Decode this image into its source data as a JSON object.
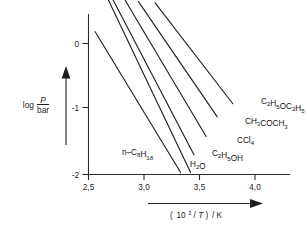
{
  "chart_data": {
    "type": "line",
    "title": "",
    "xlabel": "( 10³/T ) / K",
    "ylabel": "log P/bar",
    "xlim": [
      2.5,
      4.0
    ],
    "ylim": [
      -2.0,
      0.7
    ],
    "grid": false,
    "legend_position": "inline-right-end-labels",
    "xticks": [
      2.5,
      3.0,
      3.5,
      4.0
    ],
    "xtick_labels": [
      "2,5",
      "3,0",
      "3,5",
      "4,0"
    ],
    "yticks": [
      0,
      -1,
      -2
    ],
    "ytick_labels": [
      "0",
      "-1",
      "-2"
    ],
    "series": [
      {
        "name": "C2H5OC2H5",
        "label_parts": [
          {
            "t": "C",
            "k": "n"
          },
          {
            "t": "2",
            "k": "sub"
          },
          {
            "t": "H",
            "k": "n"
          },
          {
            "t": "5",
            "k": "sub"
          },
          {
            "t": "OC",
            "k": "n"
          },
          {
            "t": "2",
            "k": "sub"
          },
          {
            "t": "H",
            "k": "n"
          },
          {
            "t": "5",
            "k": "sub"
          }
        ],
        "x": [
          3.1,
          3.8
        ],
        "y": [
          0.62,
          -0.92
        ],
        "label_x": 261,
        "label_y": 104
      },
      {
        "name": "CH3COCH3",
        "label_parts": [
          {
            "t": "CH",
            "k": "n"
          },
          {
            "t": "3",
            "k": "sub"
          },
          {
            "t": "COCH",
            "k": "n"
          },
          {
            "t": "3",
            "k": "sub"
          }
        ],
        "x": [
          2.95,
          3.66
        ],
        "y": [
          0.64,
          -1.12
        ],
        "label_x": 245,
        "label_y": 124
      },
      {
        "name": "CCl4",
        "label_parts": [
          {
            "t": "CCl",
            "k": "n"
          },
          {
            "t": "4",
            "k": "sub"
          }
        ],
        "x": [
          2.83,
          3.56
        ],
        "y": [
          0.66,
          -1.42
        ],
        "label_x": 237,
        "label_y": 143
      },
      {
        "name": "C2H5OH",
        "label_parts": [
          {
            "t": "C",
            "k": "n"
          },
          {
            "t": "2",
            "k": "sub"
          },
          {
            "t": "H",
            "k": "n"
          },
          {
            "t": "5",
            "k": "sub"
          },
          {
            "t": "OH",
            "k": "n"
          }
        ],
        "x": [
          2.72,
          3.45
        ],
        "y": [
          0.67,
          -1.7
        ],
        "label_x": 212,
        "label_y": 156
      },
      {
        "name": "H2O",
        "label_parts": [
          {
            "t": "H",
            "k": "n"
          },
          {
            "t": "2",
            "k": "sub"
          },
          {
            "t": "O",
            "k": "n"
          }
        ],
        "x": [
          2.68,
          3.42
        ],
        "y": [
          0.66,
          -1.97
        ],
        "label_x": 190,
        "label_y": 167
      },
      {
        "name": "n-C8H18",
        "label_parts": [
          {
            "t": "n–C",
            "k": "n"
          },
          {
            "t": "8",
            "k": "sub"
          },
          {
            "t": "H",
            "k": "n"
          },
          {
            "t": "18",
            "k": "sub"
          }
        ],
        "x": [
          2.56,
          3.33
        ],
        "y": [
          0.18,
          -1.97
        ],
        "label_x": 122,
        "label_y": 155
      }
    ],
    "axis_arrows": {
      "y_arrow": "upward arrow beside y-axis label",
      "x_arrow": "rightward arrow above x-axis label"
    }
  },
  "axis": {
    "y_label_prefix": "log",
    "y_label_numerator": "P",
    "y_label_denominator": "bar",
    "x_label_open": "(",
    "x_label_base": "10",
    "x_label_exp": "3",
    "x_label_slash": "/",
    "x_label_var": "T",
    "x_label_close": ")",
    "x_label_unit": "/ K"
  }
}
